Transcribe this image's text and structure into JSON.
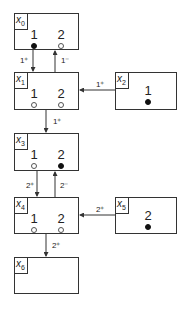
{
  "nodes": {
    "x0": {
      "label": "x",
      "sub": "0",
      "places": [
        {
          "num": "1",
          "token": "filled"
        },
        {
          "num": "2",
          "token": "empty"
        }
      ]
    },
    "x1": {
      "label": "x",
      "sub": "1",
      "places": [
        {
          "num": "1",
          "token": "empty"
        },
        {
          "num": "2",
          "token": "empty"
        }
      ]
    },
    "x2": {
      "label": "x",
      "sub": "2",
      "places": [
        {
          "num": "1",
          "token": "filled"
        }
      ]
    },
    "x3": {
      "label": "x",
      "sub": "3",
      "places": [
        {
          "num": "1",
          "token": "empty"
        },
        {
          "num": "2",
          "token": "filled"
        }
      ]
    },
    "x4": {
      "label": "x",
      "sub": "4",
      "places": [
        {
          "num": "1",
          "token": "empty"
        },
        {
          "num": "2",
          "token": "empty"
        }
      ]
    },
    "x5": {
      "label": "x",
      "sub": "5",
      "places": [
        {
          "num": "2",
          "token": "filled"
        }
      ]
    },
    "x6": {
      "label": "x",
      "sub": "6",
      "places": []
    }
  },
  "edges": [
    {
      "from": "x0",
      "to": "x1",
      "label": "1⁺"
    },
    {
      "from": "x1",
      "to": "x0",
      "label": "1⁻"
    },
    {
      "from": "x2",
      "to": "x1",
      "label": "1⁺"
    },
    {
      "from": "x1",
      "to": "x3",
      "label": "1⁺"
    },
    {
      "from": "x3",
      "to": "x4",
      "label": "2⁺"
    },
    {
      "from": "x4",
      "to": "x3",
      "label": "2⁻"
    },
    {
      "from": "x5",
      "to": "x4",
      "label": "2⁺"
    },
    {
      "from": "x4",
      "to": "x6",
      "label": "2⁺"
    }
  ]
}
